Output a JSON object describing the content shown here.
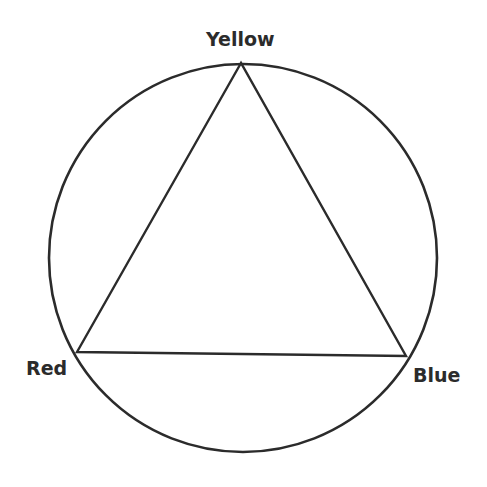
{
  "diagram": {
    "stroke_color": "#2b2b2b",
    "circle": {
      "cx": 243,
      "cy": 258,
      "r": 194
    },
    "vertices": [
      {
        "name": "yellow",
        "label": "Yellow",
        "x": 241,
        "y": 63
      },
      {
        "name": "red",
        "label": "Red",
        "x": 77,
        "y": 352
      },
      {
        "name": "blue",
        "label": "Blue",
        "x": 406,
        "y": 356
      }
    ]
  }
}
